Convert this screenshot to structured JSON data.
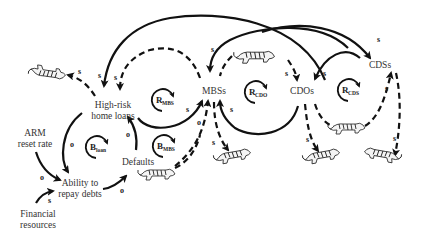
{
  "diagram": {
    "nodes": [
      {
        "id": "high_risk_loans",
        "lines": [
          "High-risk",
          "home loans"
        ]
      },
      {
        "id": "mbss",
        "lines": [
          "MBSs"
        ]
      },
      {
        "id": "cdos",
        "lines": [
          "CDOs"
        ]
      },
      {
        "id": "cdss",
        "lines": [
          "CDSs"
        ]
      },
      {
        "id": "arm_reset",
        "lines": [
          "ARM",
          "reset rate"
        ]
      },
      {
        "id": "ability",
        "lines": [
          "Ability to",
          "repay debts"
        ]
      },
      {
        "id": "defaults",
        "lines": [
          "Defaults"
        ]
      },
      {
        "id": "financial",
        "lines": [
          "Financial",
          "resources"
        ]
      }
    ],
    "loops": [
      {
        "id": "r_mbs",
        "main": "R",
        "sub": "MBS"
      },
      {
        "id": "r_cdo",
        "main": "R",
        "sub": "CDO"
      },
      {
        "id": "r_cds",
        "main": "R",
        "sub": "CDS"
      },
      {
        "id": "b_loan",
        "main": "B",
        "sub": "loan"
      },
      {
        "id": "b_mbs",
        "main": "B",
        "sub": "MBS"
      }
    ],
    "polarity": {
      "same": "s",
      "opposite": "o"
    },
    "edges": [
      {
        "from": "cdos",
        "to": "high_risk_loans",
        "style": "solid",
        "polarity": "s"
      },
      {
        "from": "mbss",
        "to": "high_risk_loans",
        "style": "dashed",
        "polarity": "s"
      },
      {
        "from": "high_risk_loans",
        "to": "tiger_1",
        "style": "dashed",
        "polarity": "s"
      },
      {
        "from": "high_risk_loans",
        "to": "mbss",
        "style": "solid",
        "polarity": "s"
      },
      {
        "from": "cdss",
        "to": "mbss",
        "style": "solid",
        "polarity": "s"
      },
      {
        "from": "tiger_2",
        "to": "cdos",
        "style": "dashed",
        "polarity": "s"
      },
      {
        "from": "cdss",
        "to": "cdos",
        "style": "solid",
        "polarity": "s"
      },
      {
        "from": "mbss",
        "to": "cdss",
        "style": "solid",
        "polarity": "s"
      },
      {
        "from": "cdos",
        "to": "mbss",
        "style": "solid",
        "polarity": "s"
      },
      {
        "from": "defaults",
        "to": "mbss",
        "style": "dashed",
        "polarity": "o"
      },
      {
        "from": "mbss",
        "to": "tiger_3",
        "style": "dashed",
        "polarity": "s"
      },
      {
        "from": "cdos",
        "to": "tiger_4",
        "style": "dashed",
        "polarity": "s"
      },
      {
        "from": "cdos",
        "to": "cdss",
        "style": "dashed",
        "polarity": "s"
      },
      {
        "from": "cdss",
        "to": "tiger_5",
        "style": "dashed",
        "polarity": "s"
      },
      {
        "from": "high_risk_loans",
        "to": "ability",
        "style": "solid",
        "polarity": "o"
      },
      {
        "from": "defaults",
        "to": "high_risk_loans",
        "style": "solid",
        "polarity": "o"
      },
      {
        "from": "arm_reset",
        "to": "ability",
        "style": "solid",
        "polarity": "o"
      },
      {
        "from": "financial",
        "to": "ability",
        "style": "solid",
        "polarity": "s"
      },
      {
        "from": "ability",
        "to": "defaults",
        "style": "solid",
        "polarity": "o"
      }
    ],
    "tigers": [
      {
        "id": "tiger_1",
        "position": "upper-left"
      },
      {
        "id": "tiger_2",
        "position": "top-center"
      },
      {
        "id": "tiger_3",
        "position": "below-mbss"
      },
      {
        "id": "tiger_4",
        "position": "below-cdos"
      },
      {
        "id": "tiger_5",
        "position": "below-cdss"
      },
      {
        "id": "tiger_6",
        "position": "on-defaults-link"
      },
      {
        "id": "tiger_7",
        "position": "between-cdos-cdss"
      }
    ]
  }
}
